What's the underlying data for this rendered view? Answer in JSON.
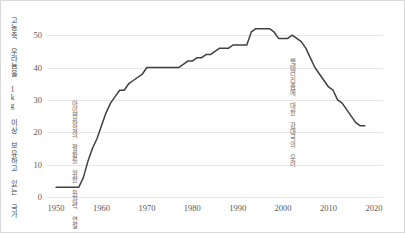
{
  "chart_data": {
    "type": "line",
    "title": "",
    "subtitle": "",
    "xlabel": "",
    "ylabel": "고농축 우라늄을 1kg 이상 보유하고 있는 국가",
    "xlim": [
      1948,
      2022
    ],
    "ylim": [
      0,
      55
    ],
    "grid": true,
    "legend": null,
    "legend_position": "none",
    "line_color": "#404040",
    "grid_color": "#e6e6e6",
    "tick_color": "#595959",
    "xticks": [
      "1950",
      "1960",
      "1970",
      "1980",
      "1990",
      "2000",
      "2010",
      "2020"
    ],
    "xtick_values": [
      1950,
      1960,
      1970,
      1980,
      1990,
      2000,
      2010,
      2020
    ],
    "yticks": [
      "0",
      "10",
      "20",
      "30",
      "40",
      "50"
    ],
    "ytick_values": [
      0,
      10,
      20,
      30,
      40,
      50
    ],
    "series": [
      {
        "name": "고농축 우라늄 1kg 이상 보유국 수",
        "x": [
          1950,
          1951,
          1952,
          1953,
          1954,
          1955,
          1956,
          1957,
          1958,
          1959,
          1960,
          1961,
          1962,
          1963,
          1964,
          1965,
          1966,
          1967,
          1968,
          1969,
          1970,
          1971,
          1972,
          1973,
          1974,
          1975,
          1976,
          1977,
          1978,
          1979,
          1980,
          1981,
          1982,
          1983,
          1984,
          1985,
          1986,
          1987,
          1988,
          1989,
          1990,
          1991,
          1992,
          1993,
          1994,
          1995,
          1996,
          1997,
          1998,
          1999,
          2000,
          2001,
          2002,
          2003,
          2004,
          2005,
          2006,
          2007,
          2008,
          2009,
          2010,
          2011,
          2012,
          2013,
          2014,
          2015,
          2016,
          2017,
          2018
        ],
        "values": [
          3,
          3,
          3,
          3,
          3,
          3,
          6,
          11,
          15,
          18,
          22,
          26,
          29,
          31,
          33,
          33,
          35,
          36,
          37,
          38,
          40,
          40,
          40,
          40,
          40,
          40,
          40,
          40,
          41,
          42,
          42,
          43,
          43,
          44,
          44,
          45,
          46,
          46,
          46,
          47,
          47,
          47,
          47,
          51,
          52,
          52,
          52,
          52,
          51,
          49,
          49,
          49,
          50,
          49,
          48,
          46,
          43,
          40,
          38,
          36,
          34,
          33,
          30,
          29,
          27,
          25,
          23,
          22,
          22
        ]
      }
    ],
    "annotations": [
      {
        "text": "아이젠하워의 평화를 위한 원자력 연설",
        "x": 1953,
        "y_top": 30
      },
      {
        "text": "핵테러리즘에 대한 강대국의 우려",
        "x": 2001,
        "y_top": 43
      }
    ]
  }
}
